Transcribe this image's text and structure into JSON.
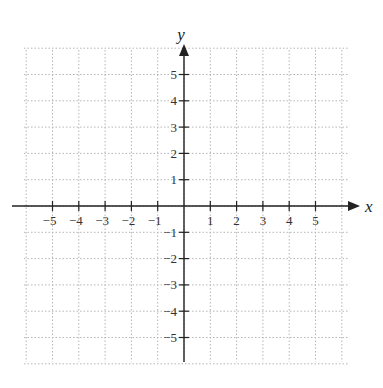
{
  "chart_data": {
    "type": "coordinate-grid",
    "title": "",
    "xlabel": "x",
    "ylabel": "y",
    "xlim": [
      -6,
      6
    ],
    "ylim": [
      -6,
      6
    ],
    "x_ticks": [
      -5,
      -4,
      -3,
      -2,
      -1,
      1,
      2,
      3,
      4,
      5
    ],
    "y_ticks": [
      -5,
      -4,
      -3,
      -2,
      -1,
      1,
      2,
      3,
      4,
      5
    ],
    "x_tick_labels": [
      "−5",
      "−4",
      "−3",
      "−2",
      "−1",
      "1",
      "2",
      "3",
      "4",
      "5"
    ],
    "y_tick_labels": [
      "−5",
      "−4",
      "−3",
      "−2",
      "−1",
      "1",
      "2",
      "3",
      "4",
      "5"
    ],
    "grid": true,
    "grid_style": "dotted",
    "series": []
  },
  "axes": {
    "x_name": "x",
    "y_name": "y"
  },
  "colors": {
    "axis": "#222222",
    "grid": "#b5b5b5",
    "background": "#ffffff"
  },
  "layout": {
    "origin_x": 184,
    "origin_y": 206,
    "unit": 26.3,
    "grid_left": 24,
    "grid_right": 348,
    "grid_top": 50,
    "grid_bottom": 362
  }
}
